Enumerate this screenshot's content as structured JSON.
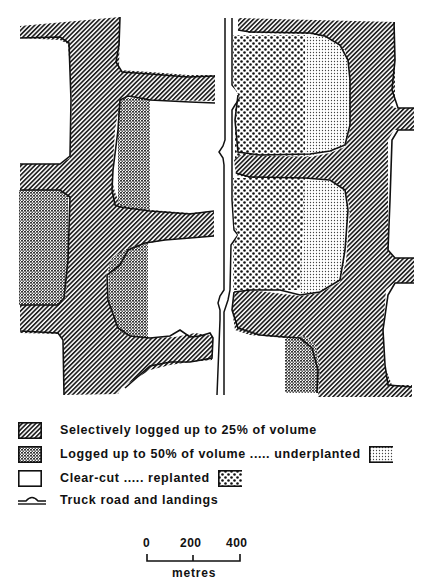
{
  "figure": {
    "type": "schematic land-use map of partial-cut / clear-cut logging patterns along a truck road",
    "colors": {
      "ink": "#111111",
      "background": "#ffffff",
      "hatch_fill": "#8c8c8c"
    }
  },
  "map": {
    "road": {
      "label": "Truck road and landings",
      "orientation": "vertical",
      "landings_count": 4
    },
    "zones": [
      {
        "id": "selective",
        "pattern": "diagonal-hatch",
        "meaning": "Selectively logged up to 25% of volume"
      },
      {
        "id": "logged50",
        "pattern": "cross-hatch",
        "meaning": "Logged up to 50% of volume"
      },
      {
        "id": "underplanted",
        "pattern": "fine-dots",
        "meaning": "underplanted"
      },
      {
        "id": "clearcut",
        "pattern": "white",
        "meaning": "Clear-cut"
      },
      {
        "id": "replanted",
        "pattern": "coarse-dots",
        "meaning": "replanted"
      }
    ]
  },
  "legend": {
    "items": [
      {
        "swatch": "diagonal-hatch",
        "label": "Selectively logged up to 25% of volume"
      },
      {
        "swatch": "cross-hatch",
        "label": "Logged up to 50% of volume ..... underplanted",
        "trailing_swatch": "fine-dots"
      },
      {
        "swatch": "white",
        "label": "Clear-cut ..... replanted",
        "trailing_swatch": "coarse-dots"
      },
      {
        "swatch": "road-line",
        "label": "Truck road and landings"
      }
    ]
  },
  "scale_bar": {
    "ticks": [
      "0",
      "200",
      "400"
    ],
    "unit": "metres"
  }
}
